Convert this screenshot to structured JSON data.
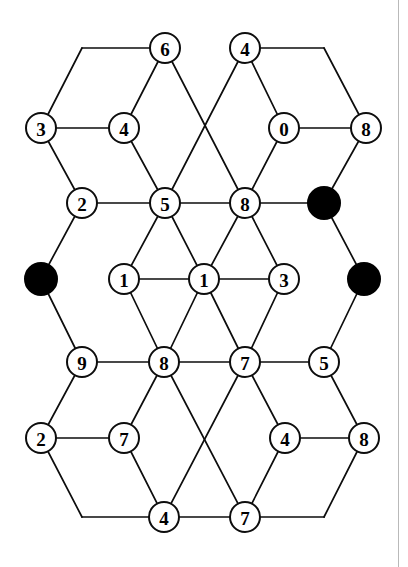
{
  "figure": {
    "type": "node-link-graph",
    "width": 408,
    "height": 567,
    "background_color": "#ffffff",
    "edge_color": "#0d0d0d",
    "open_node_fill": "#ffffff",
    "filled_node_fill": "#000000",
    "node_radius": 15,
    "filled_node_radius": 16
  },
  "nodes": [
    {
      "id": "n-top-6",
      "label": "6",
      "x": 165,
      "y": 48,
      "filled": false
    },
    {
      "id": "n-top-4",
      "label": "4",
      "x": 245,
      "y": 48,
      "filled": false
    },
    {
      "id": "n-r2-3",
      "label": "3",
      "x": 41,
      "y": 128,
      "filled": false
    },
    {
      "id": "n-r2-4",
      "label": "4",
      "x": 124,
      "y": 128,
      "filled": false
    },
    {
      "id": "n-r2-0",
      "label": "0",
      "x": 284,
      "y": 128,
      "filled": false
    },
    {
      "id": "n-r2-8",
      "label": "8",
      "x": 366,
      "y": 128,
      "filled": false
    },
    {
      "id": "n-r3-2",
      "label": "2",
      "x": 82,
      "y": 203,
      "filled": false
    },
    {
      "id": "n-r3-5",
      "label": "5",
      "x": 165,
      "y": 203,
      "filled": false
    },
    {
      "id": "n-r3-8",
      "label": "8",
      "x": 245,
      "y": 203,
      "filled": false
    },
    {
      "id": "n-r3-black",
      "label": "",
      "x": 324,
      "y": 203,
      "filled": true
    },
    {
      "id": "n-r4-black-l",
      "label": "",
      "x": 41,
      "y": 279,
      "filled": true
    },
    {
      "id": "n-r4-1a",
      "label": "1",
      "x": 124,
      "y": 279,
      "filled": false
    },
    {
      "id": "n-r4-1b",
      "label": "1",
      "x": 204,
      "y": 279,
      "filled": false
    },
    {
      "id": "n-r4-3",
      "label": "3",
      "x": 284,
      "y": 279,
      "filled": false
    },
    {
      "id": "n-r4-black-r",
      "label": "",
      "x": 364,
      "y": 279,
      "filled": true
    },
    {
      "id": "n-r5-9",
      "label": "9",
      "x": 82,
      "y": 362,
      "filled": false
    },
    {
      "id": "n-r5-8",
      "label": "8",
      "x": 164,
      "y": 362,
      "filled": false
    },
    {
      "id": "n-r5-7",
      "label": "7",
      "x": 245,
      "y": 362,
      "filled": false
    },
    {
      "id": "n-r5-5",
      "label": "5",
      "x": 324,
      "y": 362,
      "filled": false
    },
    {
      "id": "n-r6-2",
      "label": "2",
      "x": 41,
      "y": 438,
      "filled": false
    },
    {
      "id": "n-r6-7",
      "label": "7",
      "x": 124,
      "y": 438,
      "filled": false
    },
    {
      "id": "n-r6-4",
      "label": "4",
      "x": 285,
      "y": 438,
      "filled": false
    },
    {
      "id": "n-r6-8",
      "label": "8",
      "x": 364,
      "y": 438,
      "filled": false
    },
    {
      "id": "n-r7-4",
      "label": "4",
      "x": 164,
      "y": 517,
      "filled": false
    },
    {
      "id": "n-r7-7",
      "label": "7",
      "x": 245,
      "y": 517,
      "filled": false
    }
  ],
  "bend_points": [
    {
      "id": "b-top-left",
      "x": 82,
      "y": 48
    },
    {
      "id": "b-top-right",
      "x": 324,
      "y": 48
    },
    {
      "id": "b-bottom-left",
      "x": 82,
      "y": 517
    },
    {
      "id": "b-bottom-right",
      "x": 324,
      "y": 517
    }
  ],
  "edges": [
    {
      "from": "n-r2-3",
      "to": "b-top-left"
    },
    {
      "from": "b-top-left",
      "to": "n-top-6"
    },
    {
      "from": "n-top-6",
      "to": "n-r2-4"
    },
    {
      "from": "n-top-6",
      "to": "n-r3-8"
    },
    {
      "from": "n-top-4",
      "to": "n-r3-5"
    },
    {
      "from": "n-top-4",
      "to": "n-r2-0"
    },
    {
      "from": "n-top-4",
      "to": "b-top-right"
    },
    {
      "from": "b-top-right",
      "to": "n-r2-8"
    },
    {
      "from": "n-r2-3",
      "to": "n-r2-4"
    },
    {
      "from": "n-r2-0",
      "to": "n-r2-8"
    },
    {
      "from": "n-r2-3",
      "to": "n-r3-2"
    },
    {
      "from": "n-r2-4",
      "to": "n-r3-5"
    },
    {
      "from": "n-r2-0",
      "to": "n-r3-8"
    },
    {
      "from": "n-r2-8",
      "to": "n-r3-black"
    },
    {
      "from": "n-r3-2",
      "to": "n-r3-5"
    },
    {
      "from": "n-r3-5",
      "to": "n-r3-8"
    },
    {
      "from": "n-r3-8",
      "to": "n-r3-black"
    },
    {
      "from": "n-r3-2",
      "to": "n-r4-black-l"
    },
    {
      "from": "n-r3-5",
      "to": "n-r4-1a"
    },
    {
      "from": "n-r3-5",
      "to": "n-r4-1b"
    },
    {
      "from": "n-r3-8",
      "to": "n-r4-1b"
    },
    {
      "from": "n-r3-8",
      "to": "n-r4-3"
    },
    {
      "from": "n-r3-black",
      "to": "n-r4-black-r"
    },
    {
      "from": "n-r4-1a",
      "to": "n-r4-1b"
    },
    {
      "from": "n-r4-1b",
      "to": "n-r4-3"
    },
    {
      "from": "n-r4-black-l",
      "to": "n-r5-9"
    },
    {
      "from": "n-r4-1a",
      "to": "n-r5-8"
    },
    {
      "from": "n-r4-1b",
      "to": "n-r5-8"
    },
    {
      "from": "n-r4-1b",
      "to": "n-r5-7"
    },
    {
      "from": "n-r4-3",
      "to": "n-r5-7"
    },
    {
      "from": "n-r4-black-r",
      "to": "n-r5-5"
    },
    {
      "from": "n-r5-9",
      "to": "n-r5-8"
    },
    {
      "from": "n-r5-8",
      "to": "n-r5-7"
    },
    {
      "from": "n-r5-7",
      "to": "n-r5-5"
    },
    {
      "from": "n-r5-9",
      "to": "n-r6-2"
    },
    {
      "from": "n-r5-8",
      "to": "n-r6-7"
    },
    {
      "from": "n-r5-8",
      "to": "n-r7-7"
    },
    {
      "from": "n-r5-7",
      "to": "n-r7-4"
    },
    {
      "from": "n-r5-7",
      "to": "n-r6-4"
    },
    {
      "from": "n-r5-5",
      "to": "n-r6-8"
    },
    {
      "from": "n-r6-2",
      "to": "n-r6-7"
    },
    {
      "from": "n-r6-4",
      "to": "n-r6-8"
    },
    {
      "from": "n-r6-7",
      "to": "n-r7-4"
    },
    {
      "from": "n-r6-4",
      "to": "n-r7-7"
    },
    {
      "from": "n-r6-2",
      "to": "b-bottom-left"
    },
    {
      "from": "b-bottom-left",
      "to": "n-r7-4"
    },
    {
      "from": "n-r7-4",
      "to": "n-r7-7"
    },
    {
      "from": "n-r7-7",
      "to": "b-bottom-right"
    },
    {
      "from": "b-bottom-right",
      "to": "n-r6-8"
    }
  ]
}
